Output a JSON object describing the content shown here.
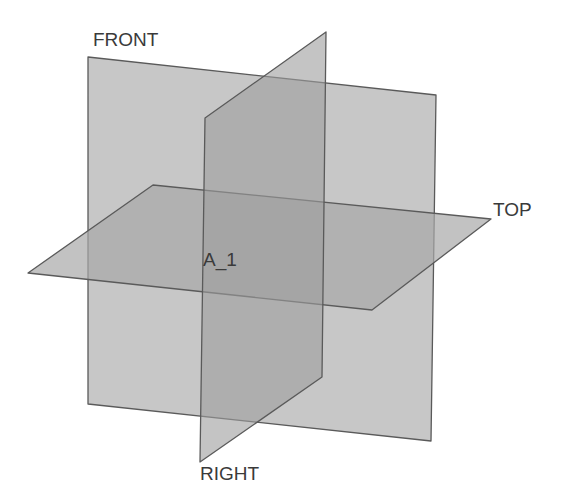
{
  "diagram": {
    "background": "#ffffff",
    "planes": {
      "front": {
        "label": "FRONT",
        "points": "88,57 436,95 431,441 88,404",
        "fill": "#b4b4b4",
        "opacity": "0.75",
        "label_pos": [
          93,
          46
        ]
      },
      "top": {
        "label": "TOP",
        "points": "28,273 153,185 491,219 372,310",
        "fill": "#a8a8a8",
        "opacity": "0.7",
        "label_pos": [
          493,
          216
        ]
      },
      "right": {
        "label": "RIGHT",
        "points": "205,118 326,32 322,377 200,462",
        "fill": "#9c9c9c",
        "opacity": "0.6",
        "label_pos": [
          200,
          466
        ]
      }
    },
    "origin": {
      "label": "A_1",
      "label_pos": [
        203,
        266
      ]
    },
    "edge_color": "#5a5a5a",
    "label_color": "#3a3a3a"
  }
}
